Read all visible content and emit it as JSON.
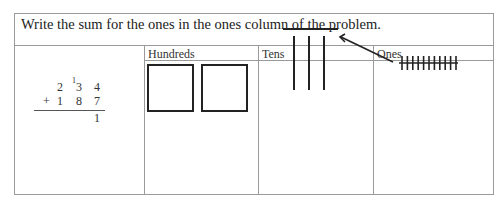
{
  "instruction": "Write the sum for the ones in the ones column of the problem.",
  "columns": [
    "Hundreds",
    "Tens",
    "Ones"
  ],
  "problem": {
    "top": [
      "2",
      "3",
      "4"
    ],
    "carry": "1",
    "operator": "+",
    "bottom": [
      "1",
      "8",
      "7"
    ],
    "answer_ones": "1"
  },
  "model": {
    "hundreds_squares": 2,
    "tens_rods": 3,
    "tens_new_rod": 1,
    "ones_tallies": 11
  }
}
